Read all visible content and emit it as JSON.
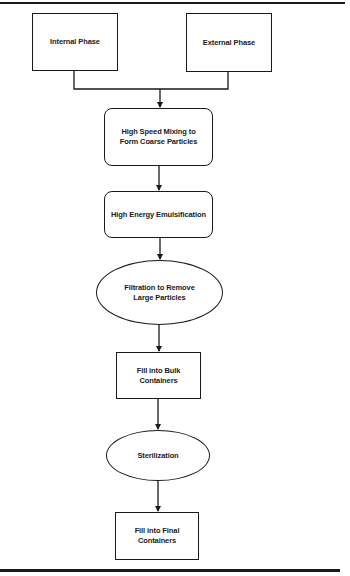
{
  "diagram": {
    "type": "flowchart",
    "line_color": "#1a1a1a",
    "background": "#ffffff",
    "nodes": [
      {
        "id": "internal",
        "shape": "rectangle",
        "label": "Internal Phase"
      },
      {
        "id": "external",
        "shape": "rectangle",
        "label": "External Phase"
      },
      {
        "id": "mixing",
        "shape": "rounded-rectangle",
        "label": "High Speed Mixing to\nForm Coarse Particles"
      },
      {
        "id": "emulsification",
        "shape": "rounded-rectangle",
        "label": "High Energy Emulsification"
      },
      {
        "id": "filtration",
        "shape": "ellipse",
        "label": "Filtration to Remove\nLarge Particles"
      },
      {
        "id": "bulk",
        "shape": "rectangle",
        "label": "Fill into Bulk\nContainers"
      },
      {
        "id": "sterilization",
        "shape": "ellipse",
        "label": "Sterilization"
      },
      {
        "id": "final",
        "shape": "rectangle",
        "label": "Fill into Final\nContainers"
      }
    ],
    "edges": [
      {
        "from": "internal",
        "to": "mixing"
      },
      {
        "from": "external",
        "to": "mixing"
      },
      {
        "from": "mixing",
        "to": "emulsification"
      },
      {
        "from": "emulsification",
        "to": "filtration"
      },
      {
        "from": "filtration",
        "to": "bulk"
      },
      {
        "from": "bulk",
        "to": "sterilization"
      },
      {
        "from": "sterilization",
        "to": "final"
      }
    ]
  }
}
